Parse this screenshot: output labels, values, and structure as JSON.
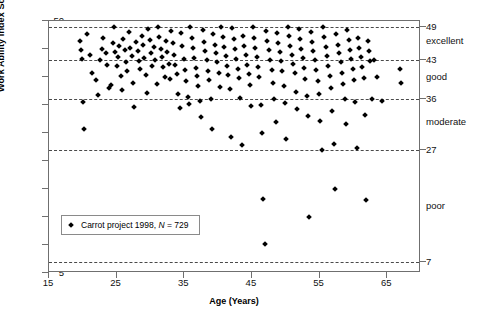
{
  "chart_data": {
    "type": "scatter",
    "title": "",
    "xlabel": "Age (Years)",
    "ylabel": "Work Ability Index Score",
    "xlim": [
      15,
      70
    ],
    "ylim": [
      5,
      50
    ],
    "xticks": [
      15,
      25,
      35,
      45,
      55,
      65
    ],
    "yticks": [
      5,
      10,
      15,
      20,
      25,
      30,
      35,
      40,
      45,
      50
    ],
    "grid": true,
    "gridlines_y": [
      49,
      43,
      36,
      27,
      7
    ],
    "legend": {
      "position": "lower-left-inside",
      "entries": [
        {
          "marker": "diamond",
          "color": "#000000",
          "label": "Carrot project 1998, N = 729"
        }
      ]
    },
    "legend_text_plain": "Carrot project 1998,",
    "legend_text_italic": "N",
    "legend_text_tail": "= 729",
    "sample_size": 729,
    "right_axis_bands": [
      {
        "value": 49,
        "name": "excellent",
        "range": [
          44,
          49
        ]
      },
      {
        "value": 43,
        "name": "good",
        "range": [
          37,
          43
        ]
      },
      {
        "value": 36,
        "name": "moderate",
        "range": [
          28,
          36
        ]
      },
      {
        "value": 27,
        "name": "poor",
        "range": [
          7,
          27
        ]
      },
      {
        "value": 7,
        "name": ""
      }
    ],
    "series": [
      {
        "name": "Carrot project 1998",
        "marker": "diamond",
        "color": "#000000",
        "points": [
          [
            19.6,
            46.5
          ],
          [
            19.7,
            44.9
          ],
          [
            19.9,
            43.2
          ],
          [
            20.0,
            35.5
          ],
          [
            20.2,
            30.8
          ],
          [
            20.6,
            47.6
          ],
          [
            21.1,
            44.0
          ],
          [
            21.4,
            40.8
          ],
          [
            21.9,
            39.4
          ],
          [
            22.3,
            36.8
          ],
          [
            22.5,
            43.0
          ],
          [
            22.8,
            45.0
          ],
          [
            23.0,
            47.0
          ],
          [
            23.4,
            44.2
          ],
          [
            23.6,
            42.2
          ],
          [
            23.9,
            38.0
          ],
          [
            24.1,
            38.6
          ],
          [
            24.4,
            46.0
          ],
          [
            24.6,
            49.0
          ],
          [
            24.8,
            44.4
          ],
          [
            25.0,
            41.9
          ],
          [
            25.2,
            43.5
          ],
          [
            25.4,
            45.6
          ],
          [
            25.6,
            40.1
          ],
          [
            25.8,
            37.6
          ],
          [
            26.0,
            46.8
          ],
          [
            26.2,
            44.8
          ],
          [
            26.4,
            42.6
          ],
          [
            26.6,
            41.0
          ],
          [
            26.8,
            48.0
          ],
          [
            27.0,
            45.2
          ],
          [
            27.2,
            43.8
          ],
          [
            27.4,
            39.0
          ],
          [
            27.6,
            34.6
          ],
          [
            27.9,
            46.2
          ],
          [
            28.1,
            44.6
          ],
          [
            28.3,
            42.8
          ],
          [
            28.5,
            41.4
          ],
          [
            28.7,
            47.4
          ],
          [
            28.9,
            45.8
          ],
          [
            29.1,
            43.4
          ],
          [
            29.3,
            40.4
          ],
          [
            29.5,
            37.2
          ],
          [
            29.7,
            48.6
          ],
          [
            29.9,
            46.6
          ],
          [
            30.1,
            44.2
          ],
          [
            30.3,
            42.0
          ],
          [
            30.5,
            45.4
          ],
          [
            30.7,
            43.0
          ],
          [
            30.9,
            38.8
          ],
          [
            31.1,
            49.0
          ],
          [
            31.3,
            47.2
          ],
          [
            31.5,
            45.0
          ],
          [
            31.7,
            43.6
          ],
          [
            31.9,
            41.8
          ],
          [
            32.1,
            40.0
          ],
          [
            32.3,
            46.4
          ],
          [
            32.5,
            44.4
          ],
          [
            32.7,
            42.4
          ],
          [
            32.9,
            39.6
          ],
          [
            33.1,
            48.2
          ],
          [
            33.3,
            46.0
          ],
          [
            33.5,
            44.0
          ],
          [
            33.7,
            42.2
          ],
          [
            33.9,
            40.6
          ],
          [
            34.1,
            37.0
          ],
          [
            34.3,
            34.4
          ],
          [
            34.5,
            47.8
          ],
          [
            34.7,
            45.6
          ],
          [
            34.9,
            43.2
          ],
          [
            35.1,
            41.2
          ],
          [
            35.3,
            39.2
          ],
          [
            35.5,
            36.4
          ],
          [
            35.7,
            35.2
          ],
          [
            35.9,
            49.0
          ],
          [
            36.1,
            47.0
          ],
          [
            36.3,
            45.2
          ],
          [
            36.5,
            43.4
          ],
          [
            36.7,
            41.6
          ],
          [
            36.9,
            40.2
          ],
          [
            37.1,
            38.4
          ],
          [
            37.3,
            35.8
          ],
          [
            37.5,
            32.9
          ],
          [
            37.7,
            48.4
          ],
          [
            37.9,
            46.2
          ],
          [
            38.1,
            44.6
          ],
          [
            38.3,
            43.0
          ],
          [
            38.5,
            41.0
          ],
          [
            38.7,
            39.4
          ],
          [
            38.9,
            36.0
          ],
          [
            39.1,
            30.8
          ],
          [
            39.3,
            47.6
          ],
          [
            39.5,
            45.8
          ],
          [
            39.7,
            44.2
          ],
          [
            39.9,
            42.6
          ],
          [
            40.1,
            40.8
          ],
          [
            40.3,
            38.2
          ],
          [
            40.5,
            49.0
          ],
          [
            40.7,
            47.2
          ],
          [
            40.9,
            45.4
          ],
          [
            41.1,
            43.8
          ],
          [
            41.3,
            42.0
          ],
          [
            41.5,
            40.4
          ],
          [
            41.7,
            37.8
          ],
          [
            41.9,
            29.2
          ],
          [
            42.1,
            48.8
          ],
          [
            42.3,
            46.8
          ],
          [
            42.5,
            45.0
          ],
          [
            42.7,
            43.2
          ],
          [
            42.9,
            41.4
          ],
          [
            43.1,
            39.8
          ],
          [
            43.3,
            36.2
          ],
          [
            43.5,
            27.8
          ],
          [
            43.7,
            47.4
          ],
          [
            43.9,
            45.6
          ],
          [
            44.1,
            44.0
          ],
          [
            44.3,
            42.2
          ],
          [
            44.5,
            40.6
          ],
          [
            44.7,
            38.6
          ],
          [
            44.9,
            34.8
          ],
          [
            45.1,
            49.0
          ],
          [
            45.3,
            47.0
          ],
          [
            45.5,
            45.2
          ],
          [
            45.7,
            43.6
          ],
          [
            45.9,
            41.8
          ],
          [
            46.1,
            40.0
          ],
          [
            46.3,
            35.0
          ],
          [
            46.5,
            30.0
          ],
          [
            46.7,
            18.2
          ],
          [
            46.9,
            10.2
          ],
          [
            47.1,
            48.2
          ],
          [
            47.3,
            46.4
          ],
          [
            47.5,
            44.8
          ],
          [
            47.7,
            43.0
          ],
          [
            47.9,
            41.2
          ],
          [
            48.1,
            39.0
          ],
          [
            48.3,
            36.0
          ],
          [
            48.5,
            32.0
          ],
          [
            48.7,
            47.8
          ],
          [
            48.9,
            46.0
          ],
          [
            49.1,
            44.4
          ],
          [
            49.3,
            42.8
          ],
          [
            49.5,
            41.0
          ],
          [
            49.7,
            38.4
          ],
          [
            49.9,
            35.4
          ],
          [
            50.1,
            29.0
          ],
          [
            50.3,
            49.0
          ],
          [
            50.5,
            47.4
          ],
          [
            50.7,
            45.6
          ],
          [
            50.9,
            44.0
          ],
          [
            51.1,
            42.4
          ],
          [
            51.3,
            40.8
          ],
          [
            51.5,
            37.4
          ],
          [
            51.7,
            34.2
          ],
          [
            51.9,
            48.6
          ],
          [
            52.1,
            46.8
          ],
          [
            52.3,
            45.0
          ],
          [
            52.5,
            43.4
          ],
          [
            52.7,
            41.6
          ],
          [
            52.9,
            39.6
          ],
          [
            53.1,
            36.6
          ],
          [
            53.3,
            33.0
          ],
          [
            53.5,
            15.0
          ],
          [
            53.7,
            48.0
          ],
          [
            53.9,
            46.2
          ],
          [
            54.1,
            44.6
          ],
          [
            54.3,
            43.0
          ],
          [
            54.5,
            41.2
          ],
          [
            54.7,
            39.2
          ],
          [
            54.9,
            37.0
          ],
          [
            55.1,
            32.2
          ],
          [
            55.3,
            27.0
          ],
          [
            55.5,
            49.0
          ],
          [
            55.7,
            47.2
          ],
          [
            55.9,
            45.4
          ],
          [
            56.1,
            43.8
          ],
          [
            56.3,
            42.0
          ],
          [
            56.5,
            40.2
          ],
          [
            56.7,
            38.0
          ],
          [
            56.9,
            34.0
          ],
          [
            57.1,
            28.0
          ],
          [
            57.3,
            20.0
          ],
          [
            57.5,
            47.6
          ],
          [
            57.7,
            45.8
          ],
          [
            57.9,
            44.2
          ],
          [
            58.1,
            42.6
          ],
          [
            58.3,
            40.8
          ],
          [
            58.5,
            38.8
          ],
          [
            58.7,
            36.0
          ],
          [
            58.9,
            31.6
          ],
          [
            59.1,
            48.4
          ],
          [
            59.3,
            46.6
          ],
          [
            59.5,
            44.8
          ],
          [
            59.7,
            43.2
          ],
          [
            59.9,
            41.4
          ],
          [
            60.1,
            39.4
          ],
          [
            60.3,
            35.6
          ],
          [
            60.5,
            27.4
          ],
          [
            60.7,
            47.0
          ],
          [
            60.9,
            45.2
          ],
          [
            61.1,
            43.6
          ],
          [
            61.3,
            41.8
          ],
          [
            61.5,
            39.8
          ],
          [
            61.7,
            33.2
          ],
          [
            61.9,
            18.0
          ],
          [
            62.1,
            46.4
          ],
          [
            62.3,
            44.6
          ],
          [
            62.5,
            42.8
          ],
          [
            62.7,
            36.0
          ],
          [
            63.1,
            43.0
          ],
          [
            63.5,
            40.0
          ],
          [
            64.3,
            35.8
          ],
          [
            66.9,
            41.5
          ],
          [
            67.1,
            39.0
          ]
        ],
        "point_count_rendered": 200
      }
    ]
  }
}
